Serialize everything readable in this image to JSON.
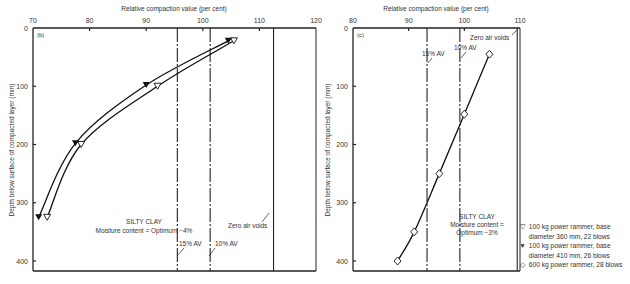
{
  "chart_data": [
    {
      "panel": "(b)",
      "type": "line",
      "title": "",
      "xlabel": "Relative compaction value (per cent)",
      "ylabel": "Depth below surface of compacted layer (mm)",
      "xlim": [
        70,
        120
      ],
      "ylim": [
        0,
        420
      ],
      "y_inverted": true,
      "xticks": [
        70,
        80,
        90,
        100,
        110,
        120
      ],
      "yticks": [
        0,
        100,
        200,
        300,
        400
      ],
      "grid": false,
      "annotation": [
        "SILTY CLAY",
        "Moisture content = Optimum −4%"
      ],
      "reference_lines": [
        {
          "label": "15% AV",
          "x": 95.5,
          "style": "dash-dot"
        },
        {
          "label": "10% AV",
          "x": 101.3,
          "style": "dash-dot"
        },
        {
          "label": "Zero air voids",
          "x": 112.5,
          "style": "solid"
        }
      ],
      "series": [
        {
          "name": "100 kg power rammer, base diameter 360 mm, 22 blows",
          "marker": "open-triangle-down",
          "x": [
            105.5,
            92,
            78.5,
            72.5
          ],
          "y": [
            22,
            100,
            200,
            325
          ]
        },
        {
          "name": "100 kg power rammer, base diameter 410 mm, 26 blows",
          "marker": "filled-triangle-down",
          "x": [
            104.5,
            90,
            77.5,
            71
          ],
          "y": [
            22,
            98,
            198,
            325
          ]
        }
      ]
    },
    {
      "panel": "(c)",
      "type": "line",
      "title": "",
      "xlabel": "Relative compaction value (per cent)",
      "ylabel": "Depth below surface of compacted layer (mm)",
      "xlim": [
        80,
        110
      ],
      "ylim": [
        0,
        420
      ],
      "y_inverted": true,
      "xticks": [
        80,
        90,
        100,
        110
      ],
      "yticks": [
        0,
        100,
        200,
        300,
        400
      ],
      "grid": false,
      "annotation": [
        "SILTY CLAY",
        "Moisture content =",
        "Optimum −3%"
      ],
      "reference_lines": [
        {
          "label": "15% AV",
          "x": 93.3,
          "style": "dash-dot"
        },
        {
          "label": "10% AV",
          "x": 99.2,
          "style": "dash-dot"
        },
        {
          "label": "Zero air voids",
          "x": 109.5,
          "style": "solid"
        }
      ],
      "series": [
        {
          "name": "600 kg power rammer, 28 blows",
          "marker": "open-diamond",
          "x": [
            104.5,
            100,
            95.5,
            91,
            88
          ],
          "y": [
            45,
            148,
            250,
            350,
            400
          ]
        }
      ]
    }
  ],
  "labels": {
    "xlabel_b": "Relative compaction value (per cent)",
    "xlabel_c": "Relative compaction value (per cent)",
    "ylabel": "Depth below surface of compacted layer (mm)",
    "panel_b": "(b)",
    "panel_c": "(c)",
    "b_note_1": "SILTY CLAY",
    "b_note_2": "Moisture content = Optimum −4%",
    "c_note_1": "SILTY CLAY",
    "c_note_2": "Moisture content =",
    "c_note_3": "Optimum −3%",
    "av15": "15% AV",
    "av10": "10% AV",
    "zav": "Zero air voids"
  },
  "legend": {
    "items": [
      {
        "symbol": "▽",
        "text": "100 kg power rammer, base"
      },
      {
        "symbol": "",
        "text": "diameter 360 mm, 22 blows"
      },
      {
        "symbol": "▼",
        "text": "100 kg power rammer, base"
      },
      {
        "symbol": "",
        "text": "diameter 410 mm, 26 blows"
      },
      {
        "symbol": "◇",
        "text": "600 kg power rammer, 28 blows"
      }
    ]
  }
}
